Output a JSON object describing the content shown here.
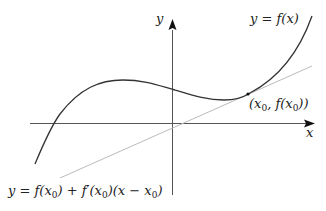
{
  "diagram": {
    "axes": {
      "x_label": "x",
      "y_label": "y"
    },
    "curve": {
      "label": "y = f(x)",
      "label_parts": {
        "lhs": "y",
        "eq": "=",
        "rhs": "f(x)"
      },
      "color": "#333333"
    },
    "tangent": {
      "label_parts": {
        "lhs": "y",
        "eq": "=",
        "t1": "f(x",
        "sub1": "0",
        "t1end": ")",
        "plus": "+",
        "t2": "f′(x",
        "sub2": "0",
        "t2end": ")(x",
        "minus": "−",
        "t3": "x",
        "sub3": "0",
        "t3end": ")"
      },
      "color": "#bbbbbb"
    },
    "point": {
      "label_parts": {
        "open": "(x",
        "sub1": "0",
        "mid": ", f(x",
        "sub2": "0",
        "close": "))"
      }
    },
    "colors": {
      "axis": "#555555",
      "curve": "#333333",
      "tangent": "#bbbbbb",
      "text": "#222222"
    }
  }
}
